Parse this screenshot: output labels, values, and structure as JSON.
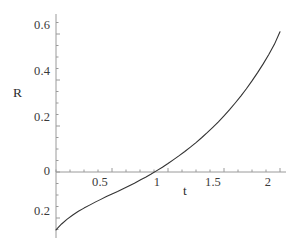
{
  "figure": {
    "background_color": "#ffffff",
    "curve_color": "#333333",
    "axis_color": "#9a9a9a",
    "text_color": "#2e2e2e"
  },
  "axes": {
    "y_axis_name": "R",
    "x_axis_name": "t",
    "y_tick_labels": [
      "0.6",
      "0.4",
      "0.2",
      "0",
      "0.2"
    ],
    "x_tick_labels": [
      "0.5",
      "1",
      "1.5",
      "2"
    ]
  },
  "chart_data": {
    "type": "line",
    "title": "",
    "subtitle": "",
    "xlabel": "t",
    "ylabel": "R",
    "xlim": [
      0,
      2.0
    ],
    "ylim": [
      -0.27,
      0.66
    ],
    "grid": false,
    "legend": null,
    "legend_position": "none",
    "x_ticks": [
      0.5,
      1,
      1.5,
      2
    ],
    "x_tick_labels": [
      "0.5",
      "1",
      "1.5",
      "2"
    ],
    "y_ticks": [
      0.6,
      0.4,
      0.2,
      0,
      -0.2
    ],
    "y_tick_labels": [
      "0.6",
      "0.4",
      "0.2",
      "0",
      "0.2"
    ],
    "y_minor_tick_step": 0.05,
    "x_minor_tick_step": 0.125,
    "zero_crossing_x": 0.76,
    "series": [
      {
        "name": "R(t)",
        "color": "#333333",
        "line_width": 1.1,
        "x": [
          0.0,
          0.05,
          0.1,
          0.15,
          0.2,
          0.25,
          0.3,
          0.35,
          0.4,
          0.45,
          0.5,
          0.55,
          0.6,
          0.65,
          0.7,
          0.76,
          0.8,
          0.85,
          0.9,
          0.95,
          1.0,
          1.05,
          1.1,
          1.15,
          1.2,
          1.25,
          1.3,
          1.35,
          1.4,
          1.45,
          1.5,
          1.55,
          1.6,
          1.65,
          1.7,
          1.75,
          1.8,
          1.85,
          1.9,
          1.95,
          2.0
        ],
        "y": [
          -0.252,
          -0.226,
          -0.205,
          -0.187,
          -0.171,
          -0.157,
          -0.144,
          -0.131,
          -0.119,
          -0.107,
          -0.096,
          -0.085,
          -0.073,
          -0.061,
          -0.049,
          -0.033,
          -0.023,
          -0.009,
          0.006,
          0.021,
          0.037,
          0.054,
          0.071,
          0.089,
          0.108,
          0.128,
          0.149,
          0.171,
          0.194,
          0.218,
          0.244,
          0.271,
          0.3,
          0.33,
          0.362,
          0.396,
          0.432,
          0.47,
          0.511,
          0.555,
          0.61
        ]
      }
    ]
  }
}
